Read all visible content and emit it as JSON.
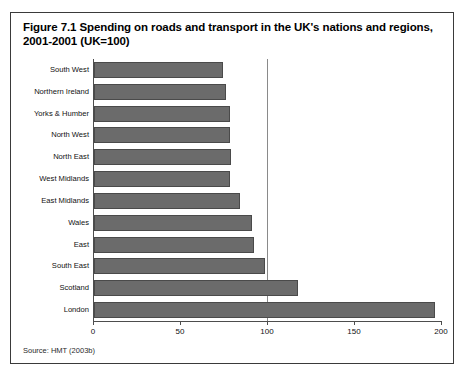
{
  "figure": {
    "title": "Figure 7.1 Spending on roads and transport in the UK's nations and regions, 2001-2001 (UK=100)",
    "source": "Source: HMT (2003b)"
  },
  "chart_data": {
    "type": "bar",
    "orientation": "horizontal",
    "title": "Figure 7.1 Spending on roads and transport in the UK's nations and regions, 2001-2001 (UK=100)",
    "xlabel": "",
    "ylabel": "",
    "xlim": [
      0,
      200
    ],
    "xticks": [
      0,
      50,
      100,
      150,
      200
    ],
    "xtick_labels": [
      "0",
      "50",
      "100",
      "150",
      "200"
    ],
    "grid": true,
    "gridlines": [
      100
    ],
    "legend": null,
    "bar_color": "#6b6b6b",
    "categories": [
      "South West",
      "Northern Ireland",
      "Yorks & Humber",
      "North West",
      "North East",
      "West Midlands",
      "East Midlands",
      "Wales",
      "East",
      "South East",
      "Scotland",
      "London"
    ],
    "values": [
      74,
      76,
      78,
      78,
      79,
      78,
      84,
      91,
      92,
      98,
      117,
      196
    ]
  }
}
